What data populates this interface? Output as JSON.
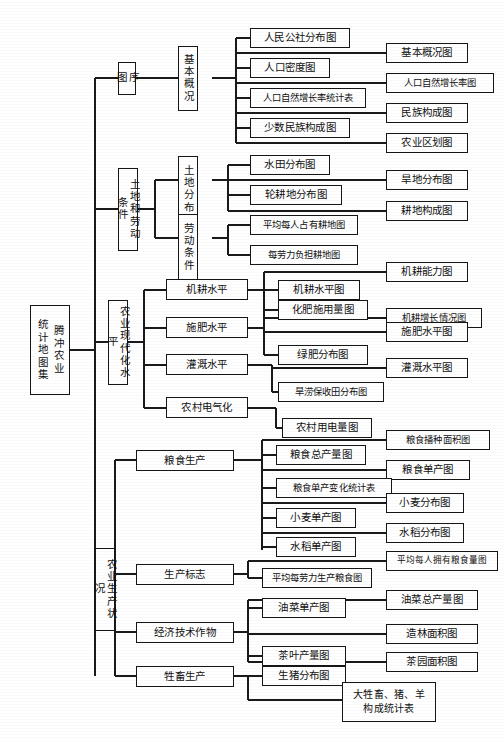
{
  "diagram": {
    "type": "tree",
    "root": {
      "col_right": "腾冲农业",
      "col_left": "统计地图集"
    },
    "level1": [
      {
        "label": "序图"
      },
      {
        "label": "土地和劳动条件"
      },
      {
        "label": "农业现代化水平"
      },
      {
        "label": "农业生产状况"
      }
    ],
    "level2": [
      {
        "label": "基本概况"
      },
      {
        "label": "土地分布"
      },
      {
        "label": "劳动条件"
      },
      {
        "label": "机耕水平"
      },
      {
        "label": "施肥水平"
      },
      {
        "label": "灌溉水平"
      },
      {
        "label": "农村电气化"
      },
      {
        "label": "粮食生产"
      },
      {
        "label": "生产标志"
      },
      {
        "label": "经济技术作物"
      },
      {
        "label": "牲畜生产"
      }
    ],
    "leaves": {
      "l01": "人民公社分布图",
      "l02": "基本概况图",
      "l03": "人口密度图",
      "l04": "人口自然增长率图",
      "l05": "人口自然增长率统计表",
      "l06": "民族构成图",
      "l07": "少数民族构成图",
      "l08": "农业区划图",
      "l09": "水田分布图",
      "l10": "旱地分布图",
      "l11": "轮耕地分布图",
      "l12": "耕地构成图",
      "l13": "平均每人占有耕地图",
      "l14": "每劳力负担耕地图",
      "l15": "机耕能力图",
      "l16": "机耕水平图",
      "l17": "机耕增长情况图",
      "l18": "化肥施用量图",
      "l19": "施肥水平图",
      "l20": "绿肥分布图",
      "l21": "灌溉水平图",
      "l22": "旱涝保收田分布图",
      "l23": "农村用电量图",
      "l24": "粮食播种面积图",
      "l25": "粮食总产量图",
      "l26": "粮食单产图",
      "l27": "粮食单产变化统计表",
      "l28": "小麦分布图",
      "l29": "小麦单产图",
      "l30": "水稻分布图",
      "l31": "水稻单产图",
      "l32": "平均每人拥有粮食量图",
      "l33": "平均每劳力生产粮食图",
      "l34": "油菜总产量图",
      "l35": "油菜单产图",
      "l36": "造林面积图",
      "l37": "茶叶产量图",
      "l38": "茶园面积图",
      "l39": "生猪分布图",
      "l40": "大牲畜、猪、羊构成统计表"
    },
    "colors": {
      "line": "#1a1a1a",
      "box_border": "#161616",
      "background": "#ffffff",
      "text": "#111111"
    }
  }
}
